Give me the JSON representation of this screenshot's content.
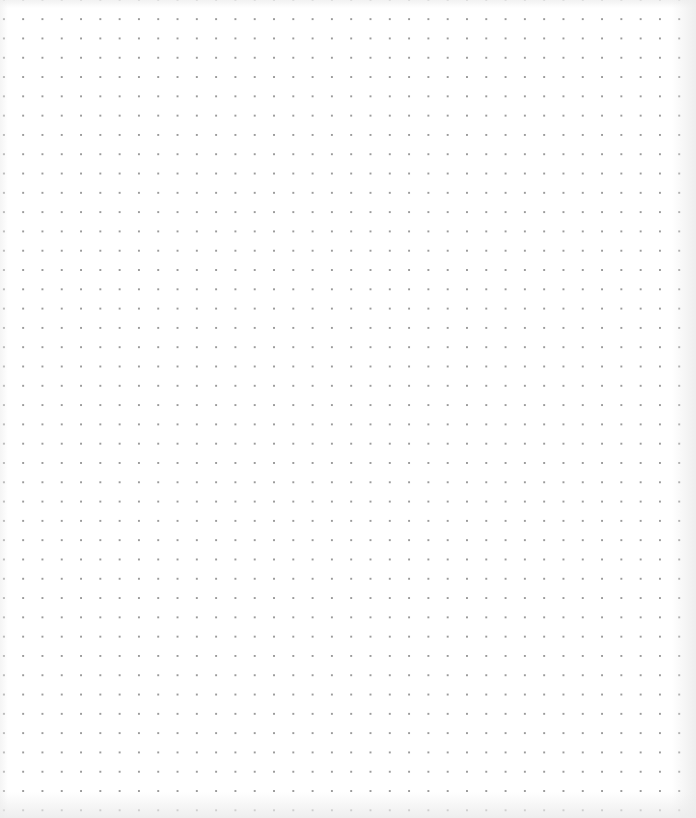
{
  "canvas": {
    "type": "dot-grid",
    "background_color": "#ffffff",
    "dot_color": "#9a9a9a",
    "dot_spacing_px": 19.3,
    "columns": 36,
    "rows": 42
  }
}
